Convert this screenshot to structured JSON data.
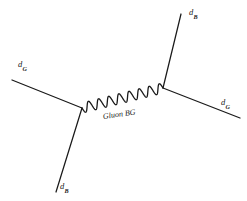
{
  "diagram": {
    "type": "feynman-diagram",
    "background_color": "#ffffff",
    "line_color": "#1a1a1a",
    "canvas": {
      "width": 247,
      "height": 201
    },
    "vertices": [
      {
        "name": "left-vertex",
        "x": 82,
        "y": 108
      },
      {
        "name": "right-vertex",
        "x": 163,
        "y": 88
      }
    ],
    "fermion_lines": [
      {
        "name": "incoming-upper-left",
        "from": [
          12,
          80
        ],
        "to": [
          82,
          108
        ]
      },
      {
        "name": "outgoing-lower-left",
        "from": [
          82,
          108
        ],
        "to": [
          56,
          192
        ]
      },
      {
        "name": "outgoing-upper-right",
        "from": [
          163,
          88
        ],
        "to": [
          181,
          14
        ]
      },
      {
        "name": "outgoing-lower-right",
        "from": [
          163,
          88
        ],
        "to": [
          240,
          118
        ]
      }
    ],
    "propagator": {
      "name": "gluon-propagator",
      "style": "sinusoidal-wave",
      "oscillations": 8,
      "amplitude": 5,
      "from": [
        82,
        108
      ],
      "to": [
        163,
        88
      ]
    },
    "labels": {
      "upper_left": {
        "particle": "d",
        "subscript": "G"
      },
      "lower_left": {
        "particle": "d",
        "subscript": "B"
      },
      "upper_right": {
        "particle": "d",
        "subscript": "B"
      },
      "lower_right": {
        "particle": "d",
        "subscript": "G"
      },
      "propagator": "Gluon BG"
    }
  }
}
